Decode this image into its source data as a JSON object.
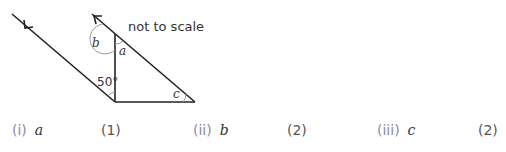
{
  "diagram": {
    "note": "not to scale",
    "angles": {
      "a": "a",
      "b": "b",
      "c": "c",
      "given": "50°"
    },
    "colors": {
      "lines": "#222222",
      "arc": "#999999"
    }
  },
  "questions": [
    {
      "number": "(i)",
      "variable": "a",
      "marks": "(1)"
    },
    {
      "number": "(ii)",
      "variable": "b",
      "marks": "(2)"
    },
    {
      "number": "(iii)",
      "variable": "c",
      "marks": "(2)"
    }
  ]
}
